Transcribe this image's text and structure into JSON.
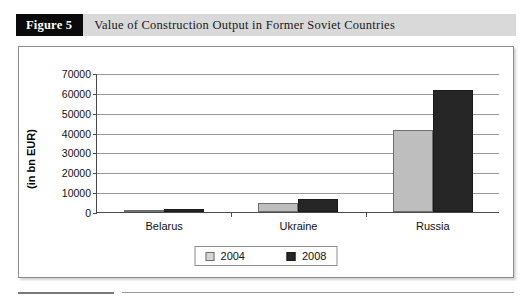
{
  "figure": {
    "badge": "Figure 5",
    "caption": "Value of Construction Output in Former Soviet Countries"
  },
  "chart_data": {
    "type": "bar",
    "title": "Value of Construction Output in Former Soviet Countries",
    "xlabel": "",
    "ylabel": "(in bn EUR)",
    "categories": [
      "Belarus",
      "Ukraine",
      "Russia"
    ],
    "series": [
      {
        "name": "2004",
        "color": "#bebebe",
        "values": [
          1000,
          4500,
          41500
        ]
      },
      {
        "name": "2008",
        "color": "#262626",
        "values": [
          1400,
          6500,
          61500
        ]
      }
    ],
    "ylim": [
      0,
      70000
    ],
    "ytick_labels": [
      "70000",
      "60000",
      "50000",
      "40000",
      "30000",
      "20000",
      "10000",
      "0"
    ],
    "ytick_values": [
      70000,
      60000,
      50000,
      40000,
      30000,
      20000,
      10000,
      0
    ],
    "grid": true,
    "legend_position": "bottom",
    "legend_entries": [
      "2004",
      "2008"
    ]
  }
}
